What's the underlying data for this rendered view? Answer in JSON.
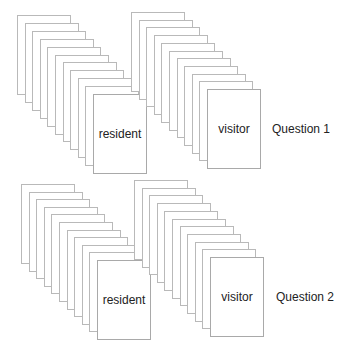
{
  "diagram": {
    "card_size": {
      "w": 54,
      "h": 80
    },
    "cards_per_stack": 11,
    "groups": [
      {
        "question_label": "Question 1",
        "question_pos": {
          "x": 272,
          "y": 122
        },
        "stacks": [
          {
            "label": "resident",
            "start": {
              "x": 17,
              "y": 15
            },
            "end": {
              "x": 93,
              "y": 94
            }
          },
          {
            "label": "visitor",
            "start": {
              "x": 131,
              "y": 12
            },
            "end": {
              "x": 207,
              "y": 89
            }
          }
        ]
      },
      {
        "question_label": "Question 2",
        "question_pos": {
          "x": 276,
          "y": 290
        },
        "stacks": [
          {
            "label": "resident",
            "start": {
              "x": 21,
              "y": 184
            },
            "end": {
              "x": 97,
              "y": 260
            }
          },
          {
            "label": "visitor",
            "start": {
              "x": 134,
              "y": 180
            },
            "end": {
              "x": 210,
              "y": 257
            }
          }
        ]
      }
    ]
  }
}
